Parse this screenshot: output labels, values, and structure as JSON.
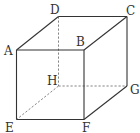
{
  "diagram": {
    "type": "cube",
    "vertices": [
      "A",
      "B",
      "C",
      "D",
      "E",
      "F",
      "G",
      "H"
    ],
    "visible_edges": [
      [
        "A",
        "B"
      ],
      [
        "B",
        "C"
      ],
      [
        "C",
        "D"
      ],
      [
        "D",
        "A"
      ],
      [
        "A",
        "E"
      ],
      [
        "B",
        "F"
      ],
      [
        "C",
        "G"
      ],
      [
        "E",
        "F"
      ],
      [
        "F",
        "G"
      ]
    ],
    "hidden_edges": [
      [
        "D",
        "H"
      ],
      [
        "H",
        "E"
      ],
      [
        "H",
        "G"
      ]
    ],
    "labels": {
      "A": "A",
      "B": "B",
      "C": "C",
      "D": "D",
      "E": "E",
      "F": "F",
      "G": "G",
      "H": "H"
    }
  }
}
